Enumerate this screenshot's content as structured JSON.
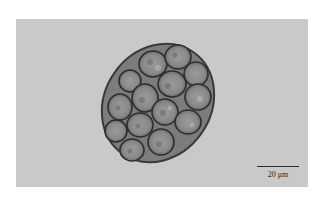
{
  "image": {
    "subject": "micrograph of a cell colony",
    "background_color": "#c9c9c9"
  },
  "scale_bar": {
    "label": "20 μm",
    "color": "#2a2a2a"
  }
}
